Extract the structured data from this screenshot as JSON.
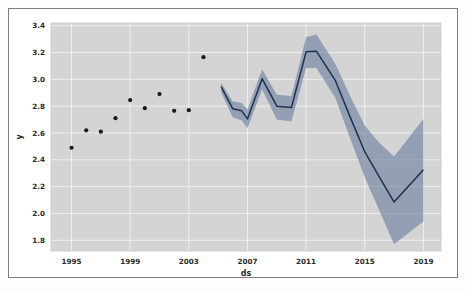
{
  "figure": {
    "background_color": "#ffffff",
    "frame_color": "#7d7d82",
    "plot_background_color": "#d4d4d4",
    "grid_color": "#f2f2f2"
  },
  "chart_data": {
    "type": "line",
    "title": "",
    "xlabel": "ds",
    "ylabel": "y",
    "xlim": [
      1993.6,
      2020.2
    ],
    "ylim": [
      1.72,
      3.42
    ],
    "grid": true,
    "legend": null,
    "x_ticks": [
      1995,
      1999,
      2003,
      2007,
      2011,
      2015,
      2019
    ],
    "x_tick_labels": [
      "1995",
      "1999",
      "2003",
      "2007",
      "2011",
      "2015",
      "2019"
    ],
    "y_ticks": [
      1.8,
      2.0,
      2.2,
      2.4,
      2.6,
      2.8,
      3.0,
      3.2,
      3.4
    ],
    "y_tick_labels": [
      "1.8",
      "2.0",
      "2.2",
      "2.4",
      "2.6",
      "2.8",
      "3.0",
      "3.2",
      "3.4"
    ],
    "series": [
      {
        "name": "observed",
        "type": "scatter",
        "marker": "circle",
        "color": "#1a1a1a",
        "points": [
          {
            "x": 1995.0,
            "y": 2.49
          },
          {
            "x": 1996.0,
            "y": 2.62
          },
          {
            "x": 1997.0,
            "y": 2.61
          },
          {
            "x": 1998.0,
            "y": 2.71
          },
          {
            "x": 1999.0,
            "y": 2.845
          },
          {
            "x": 2000.0,
            "y": 2.785
          },
          {
            "x": 2001.0,
            "y": 2.89
          },
          {
            "x": 2002.0,
            "y": 2.765
          },
          {
            "x": 2003.0,
            "y": 2.77
          },
          {
            "x": 2004.0,
            "y": 3.165
          }
        ]
      },
      {
        "name": "yhat",
        "type": "line",
        "color": "#1f3050",
        "values": [
          {
            "x": 2005.2,
            "y": 2.945
          },
          {
            "x": 2006.0,
            "y": 2.78
          },
          {
            "x": 2006.6,
            "y": 2.765
          },
          {
            "x": 2007.0,
            "y": 2.705
          },
          {
            "x": 2008.0,
            "y": 3.005
          },
          {
            "x": 2009.0,
            "y": 2.8
          },
          {
            "x": 2010.0,
            "y": 2.79
          },
          {
            "x": 2011.0,
            "y": 3.205
          },
          {
            "x": 2011.7,
            "y": 3.21
          },
          {
            "x": 2013.0,
            "y": 2.99
          },
          {
            "x": 2014.0,
            "y": 2.72
          },
          {
            "x": 2015.0,
            "y": 2.46
          },
          {
            "x": 2016.0,
            "y": 2.27
          },
          {
            "x": 2017.0,
            "y": 2.085
          },
          {
            "x": 2019.0,
            "y": 2.325
          }
        ]
      },
      {
        "name": "uncertainty_interval",
        "type": "band",
        "color": "#6a7f9e",
        "lower": [
          {
            "x": 2005.2,
            "y": 2.905
          },
          {
            "x": 2006.0,
            "y": 2.715
          },
          {
            "x": 2006.6,
            "y": 2.695
          },
          {
            "x": 2007.0,
            "y": 2.635
          },
          {
            "x": 2008.0,
            "y": 2.925
          },
          {
            "x": 2009.0,
            "y": 2.7
          },
          {
            "x": 2010.0,
            "y": 2.685
          },
          {
            "x": 2011.0,
            "y": 3.085
          },
          {
            "x": 2011.7,
            "y": 3.085
          },
          {
            "x": 2013.0,
            "y": 2.86
          },
          {
            "x": 2014.0,
            "y": 2.56
          },
          {
            "x": 2015.0,
            "y": 2.27
          },
          {
            "x": 2016.0,
            "y": 2.02
          },
          {
            "x": 2017.0,
            "y": 1.77
          },
          {
            "x": 2019.0,
            "y": 1.94
          }
        ],
        "upper": [
          {
            "x": 2005.2,
            "y": 2.975
          },
          {
            "x": 2006.0,
            "y": 2.835
          },
          {
            "x": 2006.6,
            "y": 2.825
          },
          {
            "x": 2007.0,
            "y": 2.775
          },
          {
            "x": 2008.0,
            "y": 3.075
          },
          {
            "x": 2009.0,
            "y": 2.885
          },
          {
            "x": 2010.0,
            "y": 2.875
          },
          {
            "x": 2011.0,
            "y": 3.315
          },
          {
            "x": 2011.7,
            "y": 3.335
          },
          {
            "x": 2013.0,
            "y": 3.115
          },
          {
            "x": 2014.0,
            "y": 2.875
          },
          {
            "x": 2015.0,
            "y": 2.655
          },
          {
            "x": 2016.0,
            "y": 2.525
          },
          {
            "x": 2017.0,
            "y": 2.425
          },
          {
            "x": 2019.0,
            "y": 2.705
          }
        ]
      }
    ]
  }
}
